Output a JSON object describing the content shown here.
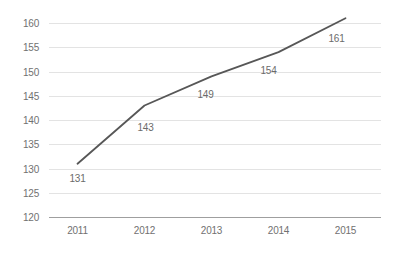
{
  "chart_data": {
    "type": "line",
    "title": "",
    "xlabel": "",
    "ylabel": "",
    "categories": [
      "2011",
      "2012",
      "2013",
      "2014",
      "2015"
    ],
    "values": [
      131,
      143,
      149,
      154,
      161
    ],
    "data_labels": [
      "131",
      "143",
      "149",
      "154",
      "161"
    ],
    "ylim": [
      120,
      160
    ],
    "yticks": [
      120,
      125,
      130,
      135,
      140,
      145,
      150,
      155,
      160
    ],
    "ytick_interval": 5,
    "grid": true,
    "legend": "none",
    "markers": false
  },
  "style": {
    "background": "#ffffff",
    "line_color": "#575757",
    "grid_color": "#e3e3e3",
    "axis_line_color": "#9f9f9f",
    "tick_label_color": "#717171",
    "data_label_color": "#6b6b6b",
    "tick_font_size": 10,
    "data_label_font_size": 10
  }
}
